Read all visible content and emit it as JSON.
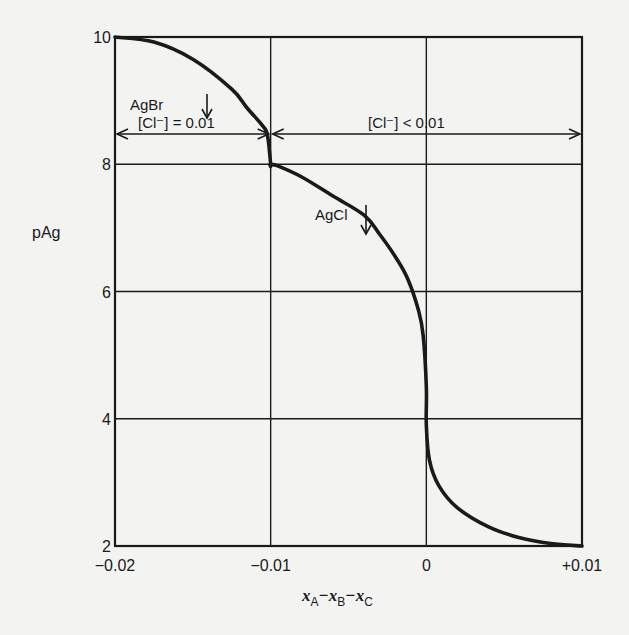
{
  "chart_data": {
    "type": "line",
    "title": "",
    "xlabel": "x_A - x_B - x_C",
    "ylabel": "pAg",
    "xlim": [
      -0.02,
      0.01
    ],
    "ylim": [
      2,
      10
    ],
    "grid": true,
    "x_ticks": [
      -0.02,
      -0.01,
      0,
      0.01
    ],
    "x_tick_labels": [
      "−0.02",
      "−0.01",
      "0",
      "+0.01"
    ],
    "y_ticks": [
      2,
      4,
      6,
      8,
      10
    ],
    "y_tick_labels": [
      "2",
      "4",
      "6",
      "8",
      "10"
    ],
    "series": [
      {
        "name": "titration curve",
        "x": [
          -0.02,
          -0.0175,
          -0.015,
          -0.0125,
          -0.0115,
          -0.0105,
          -0.0102,
          -0.01,
          -0.01,
          -0.0095,
          -0.008,
          -0.006,
          -0.004,
          -0.003,
          -0.002,
          -0.0012,
          -0.0005,
          -0.0002,
          0,
          0,
          0.0002,
          0.0008,
          0.002,
          0.004,
          0.006,
          0.008,
          0.01
        ],
        "y": [
          10,
          9.92,
          9.65,
          9.18,
          8.88,
          8.6,
          8.45,
          8.0,
          8.0,
          7.97,
          7.8,
          7.5,
          7.2,
          6.9,
          6.55,
          6.2,
          5.7,
          5.3,
          4.5,
          3.9,
          3.35,
          2.95,
          2.6,
          2.3,
          2.13,
          2.04,
          2.0
        ]
      }
    ],
    "annotations": [
      {
        "text": "AgBr",
        "arrow": "down",
        "x": -0.0155,
        "y": 9.2
      },
      {
        "text": "AgCl",
        "arrow": "down",
        "x": -0.0068,
        "y": 7.1
      },
      {
        "text": "[Cl⁻] = 0.01",
        "range": [
          -0.02,
          -0.01
        ],
        "y": 8.45,
        "type": "double-arrow"
      },
      {
        "text": "[Cl⁻] < 0.01",
        "range": [
          -0.01,
          0.01
        ],
        "y": 8.45,
        "type": "double-arrow"
      }
    ]
  },
  "labels": {
    "ylabel": "pAg",
    "xlabel_parts": [
      "x",
      "A",
      "−x",
      "B",
      "−x",
      "C"
    ],
    "agbr": "AgBr",
    "agcl": "AgCl",
    "cl_eq": "[Cl⁻] = 0.01",
    "cl_lt": "[Cl⁻] < 0.01"
  },
  "colors": {
    "background": "#f3f3f1",
    "ink": "#1a1a1a"
  }
}
